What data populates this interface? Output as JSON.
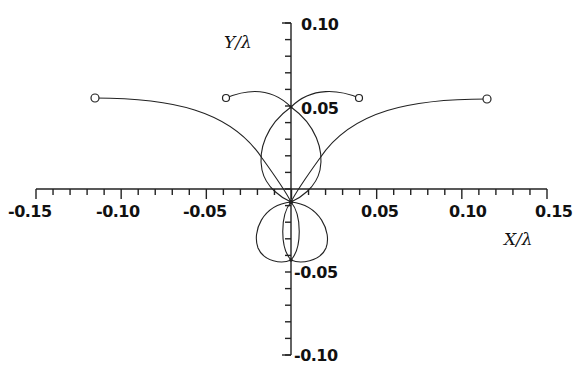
{
  "chart_data": {
    "type": "line",
    "title": "",
    "xlabel": "X/λ",
    "ylabel": "Y/λ",
    "xlim": [
      -0.15,
      0.15
    ],
    "ylim": [
      -0.1,
      0.1
    ],
    "grid": false,
    "legend": "none",
    "x_ticks": [
      "-0.15",
      "-0.10",
      "-0.05",
      "0.05",
      "0.10",
      "0.15"
    ],
    "y_ticks": [
      "0.10",
      "0.05",
      "-0.05",
      "-0.10"
    ],
    "series": [
      {
        "name": "outer trajectory left",
        "points": [
          [
            -0.115,
            0.054
          ],
          [
            -0.07,
            0.048
          ],
          [
            -0.018,
            0.019
          ],
          [
            0.0,
            -0.008
          ]
        ],
        "endpoint_marker": "open-circle"
      },
      {
        "name": "outer trajectory right",
        "points": [
          [
            0.115,
            0.054
          ],
          [
            0.07,
            0.048
          ],
          [
            0.018,
            0.019
          ],
          [
            0.0,
            -0.008
          ]
        ],
        "endpoint_marker": "open-circle"
      },
      {
        "name": "inner trajectory left",
        "points": [
          [
            -0.038,
            0.054
          ],
          [
            -0.02,
            0.058
          ],
          [
            0.0,
            0.05
          ]
        ],
        "endpoint_marker": "open-circle"
      },
      {
        "name": "inner trajectory right",
        "points": [
          [
            0.038,
            0.054
          ],
          [
            0.02,
            0.058
          ],
          [
            0.0,
            0.05
          ]
        ],
        "endpoint_marker": "open-circle"
      },
      {
        "name": "upper loop",
        "points": [
          [
            0.0,
            0.05
          ],
          [
            -0.017,
            0.016
          ],
          [
            0.0,
            -0.008
          ],
          [
            0.017,
            0.016
          ],
          [
            0.0,
            0.05
          ]
        ]
      },
      {
        "name": "lower lobes",
        "points": [
          [
            0.0,
            -0.008
          ],
          [
            -0.021,
            -0.03
          ],
          [
            0.0,
            -0.044
          ],
          [
            0.021,
            -0.03
          ],
          [
            0.0,
            -0.008
          ]
        ]
      },
      {
        "name": "inner narrow loop",
        "points": [
          [
            0.0,
            -0.008
          ],
          [
            -0.005,
            -0.026
          ],
          [
            0.0,
            -0.044
          ],
          [
            0.005,
            -0.026
          ],
          [
            0.0,
            -0.008
          ]
        ]
      }
    ]
  }
}
